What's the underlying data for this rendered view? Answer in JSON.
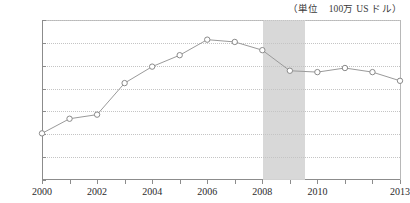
{
  "caption": {
    "unit_label": "（単位　100万 US ドル）"
  },
  "chart_data": {
    "type": "line",
    "title": "",
    "subtitle": "",
    "xlabel": "",
    "ylabel": "",
    "unit_note": "（単位　100万 US ドル）",
    "x": [
      2000,
      2001,
      2002,
      2003,
      2004,
      2005,
      2006,
      2007,
      2008,
      2009,
      2010,
      2011,
      2012,
      2013
    ],
    "categories": [
      "2000",
      "2001",
      "2002",
      "2003",
      "2004",
      "2005",
      "2006",
      "2007",
      "2008",
      "2009",
      "2010",
      "2011",
      "2012",
      "2013"
    ],
    "values": [
      10200,
      13400,
      14300,
      21200,
      24800,
      27300,
      30700,
      30200,
      28400,
      23900,
      23600,
      24500,
      23600,
      21700
    ],
    "series": [
      {
        "name": "",
        "values": [
          10200,
          13400,
          14300,
          21200,
          24800,
          27300,
          30700,
          30200,
          28400,
          23900,
          23600,
          24500,
          23600,
          21700
        ]
      }
    ],
    "xlim": [
      2000,
      2013
    ],
    "ylim": [
      0,
      35000
    ],
    "ytick_values": [
      0,
      5000,
      10000,
      15000,
      20000,
      25000,
      30000,
      35000
    ],
    "ytick_labels": [
      "0",
      "5,000",
      "10,000",
      "15,000",
      "20,000",
      "25,000",
      "30,000",
      "35,000"
    ],
    "xtick_values": [
      2000,
      2001,
      2002,
      2003,
      2004,
      2005,
      2006,
      2007,
      2008,
      2009,
      2010,
      2011,
      2012,
      2013
    ],
    "xtick_labels": [
      "2000",
      "",
      "2002",
      "",
      "2004",
      "",
      "2006",
      "",
      "2008",
      "",
      "2010",
      "",
      "",
      "2013"
    ],
    "grid": true,
    "grid_axis": "y",
    "grid_style": "dotted",
    "legend": false,
    "legend_position": "none",
    "marker": "open-circle",
    "annotations": [
      {
        "type": "vertical-band",
        "label": "",
        "x_start": 2008,
        "x_end": 2009.5,
        "color": "#d6d6d6"
      }
    ],
    "colors": {
      "line": "#9a9a9a",
      "marker_fill": "#ffffff",
      "marker_stroke": "#8a8a8a",
      "grid": "#c4c4c4",
      "axis": "#8c8c8c",
      "band": "#d6d6d6",
      "text": "#2b2b2b"
    }
  }
}
